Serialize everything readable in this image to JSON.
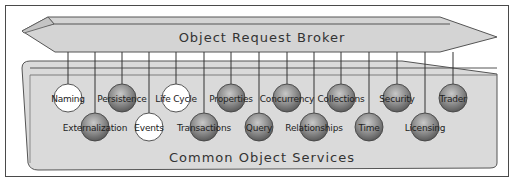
{
  "diagram": {
    "top_bar_label": "Object Request Broker",
    "bottom_container_label": "Common Object Services",
    "colors": {
      "bar_fill": "#d4d4d4",
      "container_fill": "#dcdcdc",
      "ball_shaded": "#8a8a8a",
      "ball_white": "#ffffff",
      "line": "#333333"
    },
    "services_top_row": [
      {
        "label": "Naming",
        "x": 68,
        "style": "white"
      },
      {
        "label": "Persistence",
        "x": 122,
        "style": "shaded"
      },
      {
        "label": "Life Cycle",
        "x": 176,
        "style": "white"
      },
      {
        "label": "Properties",
        "x": 231,
        "style": "shaded"
      },
      {
        "label": "Concurrency",
        "x": 287,
        "style": "shaded"
      },
      {
        "label": "Collections",
        "x": 341,
        "style": "shaded"
      },
      {
        "label": "Security",
        "x": 397,
        "style": "shaded"
      },
      {
        "label": "Trader",
        "x": 453,
        "style": "shaded"
      }
    ],
    "services_bottom_row": [
      {
        "label": "Externalization",
        "x": 95,
        "style": "shaded"
      },
      {
        "label": "Events",
        "x": 149,
        "style": "white"
      },
      {
        "label": "Transactions",
        "x": 204,
        "style": "shaded"
      },
      {
        "label": "Query",
        "x": 259,
        "style": "shaded"
      },
      {
        "label": "Relationships",
        "x": 314,
        "style": "shaded"
      },
      {
        "label": "Time",
        "x": 369,
        "style": "shaded"
      },
      {
        "label": "Licensing",
        "x": 425,
        "style": "shaded"
      }
    ]
  }
}
